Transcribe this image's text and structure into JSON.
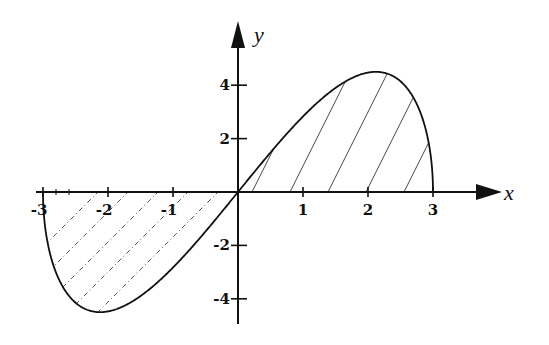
{
  "chart_data": {
    "type": "line",
    "title": "",
    "function": "y = x*sqrt(9 - x^2)",
    "xlabel": "x",
    "ylabel": "y",
    "xlim": [
      -3,
      3
    ],
    "ylim": [
      -4.5,
      4.5
    ],
    "x_ticks": [
      -3,
      -2,
      -1,
      1,
      2,
      3
    ],
    "x_tick_labels": [
      "-3",
      "-2",
      "-1",
      "1",
      "2",
      "3"
    ],
    "y_ticks": [
      4,
      2,
      -2,
      -4
    ],
    "y_tick_labels": [
      "4",
      "2",
      "-2",
      "-4"
    ],
    "grid": false,
    "legend": null,
    "series": [
      {
        "name": "curve",
        "x": [
          -3,
          -2.9,
          -2.75,
          -2.5,
          -2.12,
          -2,
          -1.5,
          -1,
          -0.5,
          0,
          0.5,
          1,
          1.5,
          2,
          2.12,
          2.5,
          2.75,
          2.9,
          3
        ],
        "y": [
          0,
          -2.23,
          -3.3,
          -4.14,
          -4.5,
          -4.47,
          -3.9,
          -2.83,
          -1.48,
          0,
          1.48,
          2.83,
          3.9,
          4.47,
          4.5,
          4.14,
          3.3,
          2.23,
          0
        ]
      }
    ],
    "shaded_regions": [
      {
        "x_range": [
          -3,
          0
        ],
        "between": "curve and x-axis",
        "hatch": "dashed diagonal"
      },
      {
        "x_range": [
          0,
          3
        ],
        "between": "curve and x-axis",
        "hatch": "solid diagonal"
      }
    ]
  },
  "labels": {
    "x_axis": "x",
    "y_axis": "y",
    "x_ticks": [
      "-3",
      "-2",
      "-1",
      "1",
      "2",
      "3"
    ],
    "y_ticks": [
      "4",
      "2",
      "-2",
      "-4"
    ]
  }
}
